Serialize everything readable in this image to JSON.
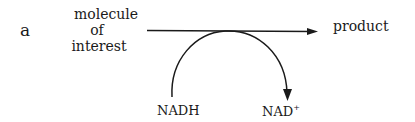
{
  "panel_label": "a",
  "substrate": {
    "line1": "molecule",
    "line2": "of",
    "line3": "interest"
  },
  "product": "product",
  "cofactor_in": "NADH",
  "cofactor_out": {
    "base": "NAD",
    "superscript": "+"
  },
  "colors": {
    "ink": "#1a1a1a",
    "background": "#ffffff"
  }
}
